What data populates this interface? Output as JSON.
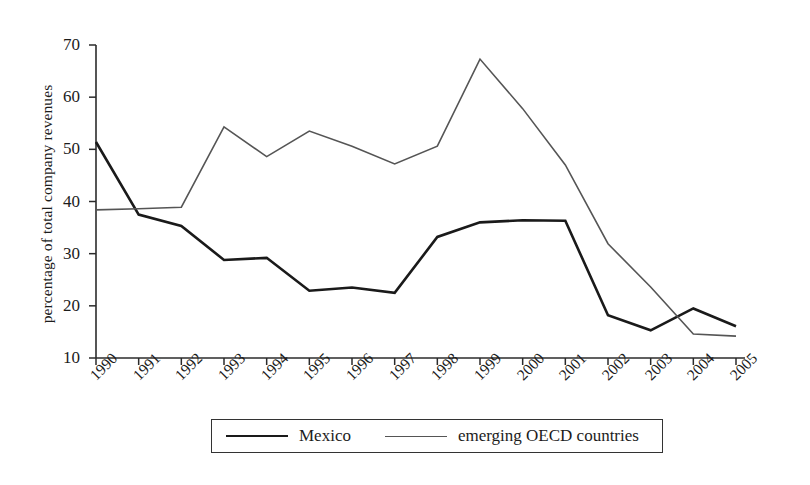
{
  "chart_data": {
    "type": "line",
    "title": "",
    "xlabel": "",
    "ylabel": "percentage of total company revenues",
    "x": [
      "1990",
      "1991",
      "1992",
      "1993",
      "1994",
      "1995",
      "1996",
      "1997",
      "1998",
      "1999",
      "2000",
      "2001",
      "2002",
      "2003",
      "2004",
      "2005"
    ],
    "categories": [
      "1990",
      "1991",
      "1992",
      "1993",
      "1994",
      "1995",
      "1996",
      "1997",
      "1998",
      "1999",
      "2000",
      "2001",
      "2002",
      "2003",
      "2004",
      "2005"
    ],
    "ylim": [
      10,
      70
    ],
    "yticks": [
      10,
      20,
      30,
      40,
      50,
      60,
      70
    ],
    "ytick_labels": [
      "10",
      "20",
      "30",
      "40",
      "50",
      "60",
      "70"
    ],
    "grid": false,
    "legend_position": "bottom",
    "series": [
      {
        "name": "Mexico",
        "color": "#1a1a1a",
        "width": 2.6,
        "values": [
          51.4,
          37.5,
          35.3,
          28.8,
          29.2,
          22.9,
          23.5,
          22.5,
          33.2,
          36.0,
          36.4,
          36.3,
          18.2,
          15.3,
          19.5,
          16.1
        ]
      },
      {
        "name": "emerging OECD countries",
        "color": "#555555",
        "width": 1.6,
        "values": [
          38.4,
          38.6,
          38.9,
          54.3,
          48.6,
          53.5,
          50.6,
          47.2,
          50.6,
          67.3,
          57.8,
          47.0,
          31.9,
          23.6,
          14.6,
          14.2
        ]
      }
    ]
  },
  "axis": {
    "y_title": "percentage of total company revenues",
    "y_tick_labels": [
      "70",
      "60",
      "50",
      "40",
      "30",
      "20",
      "10"
    ],
    "x_tick_labels": [
      "1990",
      "1991",
      "1992",
      "1993",
      "1994",
      "1995",
      "1996",
      "1997",
      "1998",
      "1999",
      "2000",
      "2001",
      "2002",
      "2003",
      "2004",
      "2005"
    ]
  },
  "legend": {
    "entries": [
      {
        "label": "Mexico",
        "style": "series-mexico"
      },
      {
        "label": "emerging OECD countries",
        "style": "series-oecd"
      }
    ]
  },
  "colors": {
    "mexico": "#1a1a1a",
    "oecd": "#555555",
    "axis": "#2b2b2b",
    "background": "#ffffff"
  }
}
